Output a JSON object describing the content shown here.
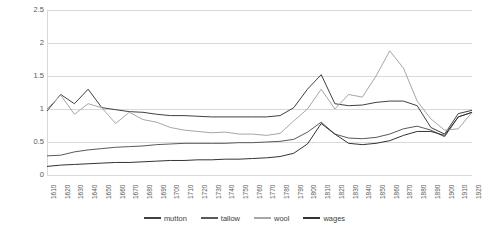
{
  "chart_data": {
    "type": "line",
    "title": "",
    "xlabel": "",
    "ylabel": "",
    "ylim": [
      0,
      2.5
    ],
    "ytick_labels": [
      "0",
      "0.5",
      "1",
      "1.5",
      "2",
      "2.5"
    ],
    "ytick_values": [
      0,
      0.5,
      1,
      1.5,
      2,
      2.5
    ],
    "grid": true,
    "legend_position": "bottom",
    "categories": [
      "1610",
      "1620",
      "1630",
      "1640",
      "1650",
      "1660",
      "1670",
      "1680",
      "1690",
      "1700",
      "1710",
      "1720",
      "1730",
      "1740",
      "1750",
      "1760",
      "1770",
      "1780",
      "1790",
      "1800",
      "1810",
      "1820",
      "1830",
      "1840",
      "1850",
      "1860",
      "1870",
      "1880",
      "1890",
      "1900",
      "1910",
      "1920"
    ],
    "series": [
      {
        "name": "mutton",
        "color": "#404040",
        "values": [
          0.97,
          1.22,
          1.08,
          1.3,
          1.02,
          0.99,
          0.96,
          0.95,
          0.92,
          0.9,
          0.9,
          0.89,
          0.88,
          0.88,
          0.88,
          0.88,
          0.88,
          0.9,
          1.02,
          1.3,
          1.52,
          1.08,
          1.05,
          1.06,
          1.1,
          1.12,
          1.12,
          1.05,
          0.72,
          0.62,
          0.93,
          0.98
        ]
      },
      {
        "name": "tallow",
        "color": "#595959",
        "values": [
          0.29,
          0.3,
          0.35,
          0.38,
          0.4,
          0.42,
          0.43,
          0.44,
          0.46,
          0.47,
          0.48,
          0.48,
          0.48,
          0.48,
          0.49,
          0.49,
          0.5,
          0.51,
          0.54,
          0.65,
          0.8,
          0.62,
          0.56,
          0.55,
          0.57,
          0.62,
          0.7,
          0.74,
          0.68,
          0.58,
          0.88,
          0.95
        ]
      },
      {
        "name": "wool",
        "color": "#a6a6a6",
        "values": [
          1.0,
          1.21,
          0.92,
          1.08,
          1.02,
          0.78,
          0.95,
          0.84,
          0.8,
          0.72,
          0.68,
          0.66,
          0.64,
          0.65,
          0.62,
          0.62,
          0.6,
          0.63,
          0.82,
          1.0,
          1.3,
          1.0,
          1.22,
          1.18,
          1.5,
          1.88,
          1.62,
          1.12,
          0.85,
          0.68,
          0.7,
          0.95
        ]
      },
      {
        "name": "wages",
        "color": "#333333",
        "values": [
          0.13,
          0.15,
          0.16,
          0.17,
          0.18,
          0.19,
          0.19,
          0.2,
          0.21,
          0.22,
          0.22,
          0.23,
          0.23,
          0.24,
          0.24,
          0.25,
          0.26,
          0.28,
          0.33,
          0.47,
          0.78,
          0.62,
          0.48,
          0.46,
          0.48,
          0.52,
          0.6,
          0.66,
          0.66,
          0.6,
          0.88,
          0.95
        ]
      }
    ]
  }
}
